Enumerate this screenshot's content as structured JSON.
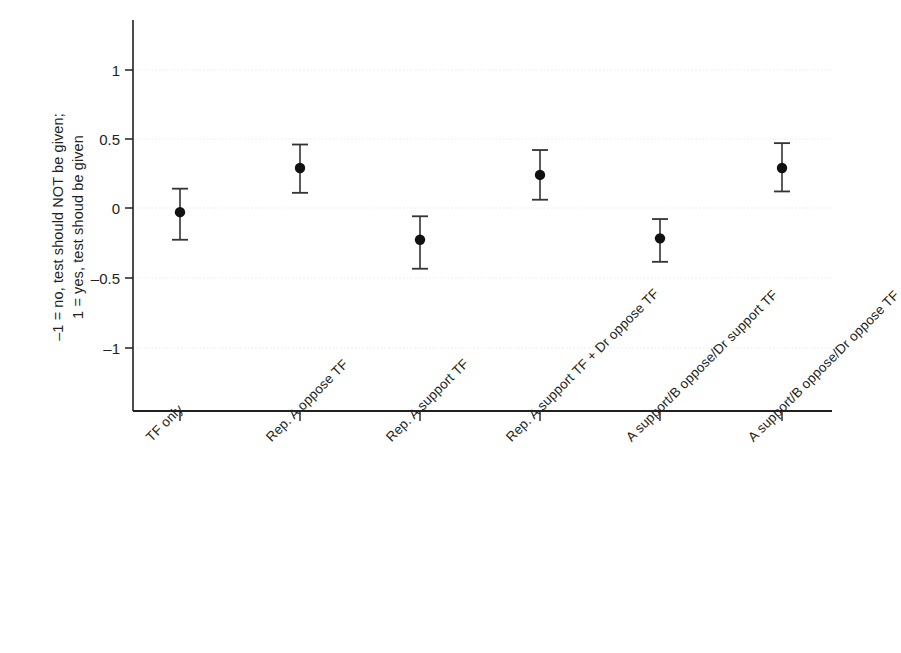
{
  "chart_data": {
    "type": "scatter",
    "title": "",
    "subtitle": "",
    "xlabel": "",
    "ylabel": "-1 = no, test should NOT be given;\n1 = yes, test shoud be given",
    "ylabel_lines": [
      "–1 = no, test should NOT be given;",
      "1 = yes, test shoud be given"
    ],
    "ylim": [
      -1.4,
      1.4
    ],
    "ytick_values": [
      1,
      0.5,
      0,
      -0.5,
      -1
    ],
    "ytick_labels": [
      "1",
      "0.5",
      "0",
      "–0.5",
      "–1"
    ],
    "grid": true,
    "grid_style": "dotted",
    "legend": "none",
    "categories": [
      "TF only",
      "Rep. A oppose TF",
      "Rep. A support TF",
      "Rep. A support TF + Dr oppose TF",
      "A support/B oppose/Dr support TF",
      "A support/B oppose/Dr oppose TF"
    ],
    "series": [
      {
        "name": "Mean with 95% CI",
        "marker": "filled-circle",
        "color": "#111111",
        "values": [
          -0.03,
          0.29,
          -0.23,
          0.24,
          -0.22,
          0.29
        ],
        "ci_low": [
          -0.23,
          0.11,
          -0.44,
          0.06,
          -0.39,
          0.12
        ],
        "ci_high": [
          0.14,
          0.46,
          -0.06,
          0.42,
          -0.08,
          0.47
        ]
      }
    ],
    "points": [
      {
        "label": "TF only",
        "value": -0.03,
        "ci_low": -0.23,
        "ci_high": 0.14
      },
      {
        "label": "Rep. A oppose TF",
        "value": 0.29,
        "ci_low": 0.11,
        "ci_high": 0.46
      },
      {
        "label": "Rep. A support TF",
        "value": -0.23,
        "ci_low": -0.44,
        "ci_high": -0.06
      },
      {
        "label": "Rep. A support TF + Dr oppose TF",
        "value": 0.24,
        "ci_low": 0.06,
        "ci_high": 0.42
      },
      {
        "label": "A support/B oppose/Dr support TF",
        "value": -0.22,
        "ci_low": -0.39,
        "ci_high": -0.08
      },
      {
        "label": "A support/B oppose/Dr oppose TF",
        "value": 0.29,
        "ci_low": 0.12,
        "ci_high": 0.47
      }
    ],
    "colors": {
      "marker": "#111111",
      "errorbar": "#333333",
      "axis": "#231f20",
      "grid": "#e8e8e8",
      "background": "#ffffff"
    }
  }
}
